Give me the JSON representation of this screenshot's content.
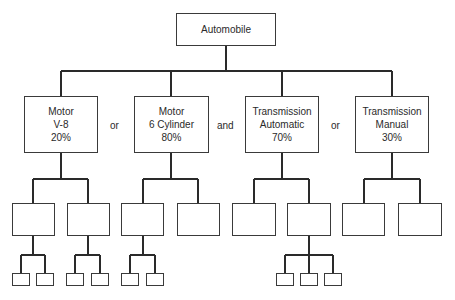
{
  "root": {
    "label": "Automobile"
  },
  "options": [
    {
      "lines": [
        "Motor",
        "V-8",
        "20%"
      ]
    },
    {
      "lines": [
        "Motor",
        "6 Cylinder",
        "80%"
      ]
    },
    {
      "lines": [
        "Transmission",
        "Automatic",
        "70%"
      ]
    },
    {
      "lines": [
        "Transmission",
        "Manual",
        "30%"
      ]
    }
  ],
  "connectors": [
    "or",
    "and",
    "or"
  ],
  "structure": {
    "level2_children_per_option": [
      2,
      2,
      2,
      2
    ],
    "level3_children": [
      [
        2,
        2
      ],
      [
        2,
        0
      ],
      [
        0,
        3
      ],
      [
        0,
        0
      ]
    ]
  }
}
